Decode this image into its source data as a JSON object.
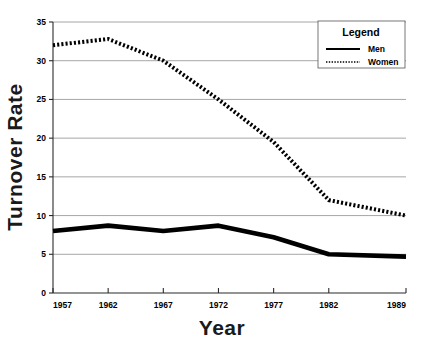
{
  "chart_data": {
    "type": "line",
    "title": "",
    "xlabel": "Year",
    "ylabel": "Turnover Rate",
    "categories": [
      "1957",
      "1962",
      "1967",
      "1972",
      "1977",
      "1982",
      "1989"
    ],
    "x": [
      1957,
      1962,
      1967,
      1972,
      1977,
      1982,
      1989
    ],
    "series": [
      {
        "name": "Men",
        "style": "solid",
        "color": "#000000",
        "values": [
          8.0,
          8.7,
          8.0,
          8.7,
          7.2,
          5.0,
          4.7
        ]
      },
      {
        "name": "Women",
        "style": "dotted",
        "color": "#000000",
        "values": [
          32.0,
          32.8,
          30.0,
          25.0,
          19.5,
          12.0,
          10.0
        ]
      }
    ],
    "ylim": [
      0,
      35
    ],
    "xlim": [
      1957,
      1989
    ],
    "yticks": [
      "0",
      "5",
      "10",
      "15",
      "20",
      "25",
      "30",
      "35"
    ],
    "ytick_values": [
      0,
      5,
      10,
      15,
      20,
      25,
      30,
      35
    ],
    "xticks": [
      "1957",
      "1962",
      "1967",
      "1972",
      "1977",
      "1982",
      "1989"
    ],
    "grid": "horizontal",
    "legend_position": "top-right",
    "legend_title": "Legend",
    "gridline_color": "#808080",
    "axis_color": "#2b2b2b",
    "background_color": "#ffffff"
  },
  "legend": {
    "title": "Legend",
    "entries": [
      {
        "label": "Men",
        "style": "solid"
      },
      {
        "label": "Women",
        "style": "dotted"
      }
    ]
  },
  "axes": {
    "x_title": "Year",
    "y_title": "Turnover Rate"
  }
}
